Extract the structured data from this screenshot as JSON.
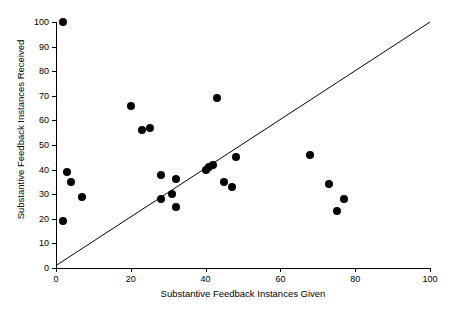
{
  "chart_data": {
    "type": "scatter",
    "title": "",
    "xlabel": "Substantive Feedback Instances Given",
    "ylabel": "Substantive Feedback Instances Received",
    "xlim": [
      0,
      100
    ],
    "ylim": [
      0,
      100
    ],
    "xticks": [
      0,
      20,
      40,
      60,
      80,
      100
    ],
    "yticks": [
      0,
      10,
      20,
      30,
      40,
      50,
      60,
      70,
      80,
      90,
      100
    ],
    "xtick_labels": [
      "0",
      "20",
      "40",
      "60",
      "80",
      "100"
    ],
    "ytick_labels": [
      "0",
      "10",
      "20",
      "30",
      "40",
      "50",
      "60",
      "70",
      "80",
      "90",
      "100"
    ],
    "grid": false,
    "legend": null,
    "marker": "filled-circle",
    "marker_color": "#000000",
    "reference_line": {
      "type": "identity",
      "description": "y = x diagonal reference line",
      "from": [
        0,
        1
      ],
      "to": [
        100,
        100
      ],
      "color": "#000000"
    },
    "points": [
      {
        "x": 2,
        "y": 100
      },
      {
        "x": 2,
        "y": 19
      },
      {
        "x": 3,
        "y": 39
      },
      {
        "x": 4,
        "y": 35
      },
      {
        "x": 7,
        "y": 29
      },
      {
        "x": 20,
        "y": 66
      },
      {
        "x": 23,
        "y": 56
      },
      {
        "x": 25,
        "y": 57
      },
      {
        "x": 28,
        "y": 38
      },
      {
        "x": 28,
        "y": 28
      },
      {
        "x": 31,
        "y": 30
      },
      {
        "x": 32,
        "y": 36
      },
      {
        "x": 32,
        "y": 25
      },
      {
        "x": 40,
        "y": 40
      },
      {
        "x": 41,
        "y": 41
      },
      {
        "x": 42,
        "y": 42
      },
      {
        "x": 43,
        "y": 69
      },
      {
        "x": 45,
        "y": 35
      },
      {
        "x": 47,
        "y": 33
      },
      {
        "x": 48,
        "y": 45
      },
      {
        "x": 68,
        "y": 46
      },
      {
        "x": 73,
        "y": 34
      },
      {
        "x": 75,
        "y": 23
      },
      {
        "x": 77,
        "y": 28
      }
    ]
  }
}
